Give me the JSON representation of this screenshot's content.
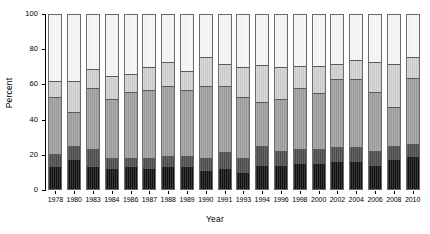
{
  "chart_data": {
    "type": "bar",
    "stacked": true,
    "title": "",
    "xlabel": "Year",
    "ylabel": "Percent",
    "ylim": [
      0,
      100
    ],
    "yticks": [
      0,
      20,
      40,
      60,
      80,
      100
    ],
    "grid": false,
    "legend": "none",
    "categories": [
      "1978",
      "1980",
      "1983",
      "1984",
      "1986",
      "1987",
      "1988",
      "1989",
      "1990",
      "1991",
      "1993",
      "1994",
      "1996",
      "1998",
      "2000",
      "2002",
      "2004",
      "2006",
      "2008",
      "2010"
    ],
    "series": [
      {
        "name": "Segment 1",
        "color": "#111111",
        "values": [
          13,
          17,
          13,
          12,
          13,
          12,
          13,
          13,
          11,
          12,
          10,
          14,
          14,
          15,
          15,
          16,
          16,
          14,
          17,
          19
        ]
      },
      {
        "name": "Segment 2",
        "color": "#4a4a4a",
        "values": [
          7,
          8,
          10,
          6,
          5,
          6,
          6,
          6,
          7,
          9,
          8,
          11,
          8,
          8,
          8,
          8,
          8,
          8,
          8,
          7
        ]
      },
      {
        "name": "Segment 3",
        "color": "#9a9a9a",
        "values": [
          33,
          19,
          35,
          34,
          38,
          39,
          40,
          38,
          41,
          38,
          35,
          25,
          30,
          35,
          32,
          39,
          39,
          34,
          22,
          38
        ]
      },
      {
        "name": "Segment 4",
        "color": "#c9c9c9",
        "values": [
          9,
          18,
          11,
          13,
          10,
          13,
          14,
          11,
          17,
          13,
          17,
          21,
          18,
          13,
          16,
          9,
          11,
          17,
          25,
          12
        ]
      },
      {
        "name": "Segment 5",
        "color": "#efefef",
        "values": [
          38,
          38,
          31,
          35,
          34,
          30,
          27,
          32,
          24,
          28,
          30,
          29,
          30,
          29,
          29,
          28,
          26,
          27,
          28,
          24
        ]
      }
    ]
  }
}
